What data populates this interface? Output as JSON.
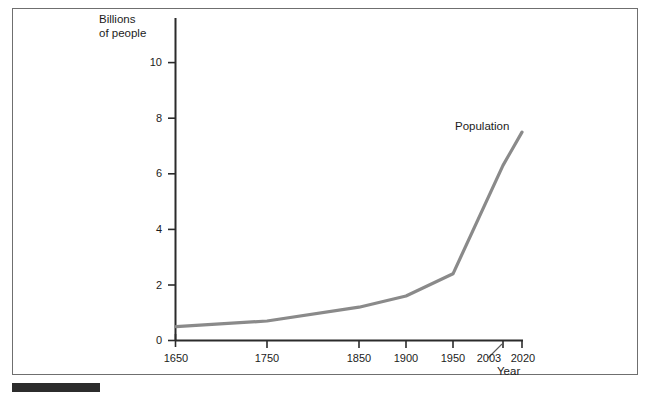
{
  "figure": {
    "y_axis_title_line1": "Billions",
    "y_axis_title_line2": "of people",
    "x_axis_title": "Year",
    "series_label": "Population",
    "line_color": "#8a8a8a",
    "axis_color": "#2b2b2b",
    "frame_color": "#6f6f6f",
    "caption_bar_color": "#2c2c2c",
    "text_color": "#1c1c1c"
  },
  "chart_data": {
    "type": "line",
    "title": "",
    "subtitle": "",
    "xlabel": "Year",
    "ylabel": "Billions of people",
    "legend": [
      "Population"
    ],
    "legend_position": "inline-right",
    "grid": false,
    "xlim": [
      1650,
      2020
    ],
    "ylim": [
      0,
      11
    ],
    "x_ticks": [
      1650,
      1750,
      1850,
      1900,
      1950,
      2003,
      2020
    ],
    "x_tick_labels": [
      "1650",
      "1750",
      "1850",
      "1900",
      "1950",
      "2003",
      "2020"
    ],
    "y_ticks": [
      0,
      2,
      4,
      6,
      8,
      10
    ],
    "y_tick_labels": [
      "0",
      "2",
      "4",
      "6",
      "8",
      "10"
    ],
    "series": [
      {
        "name": "Population",
        "x": [
          1650,
          1750,
          1850,
          1900,
          1950,
          2003,
          2020
        ],
        "values": [
          0.5,
          0.7,
          1.2,
          1.6,
          2.4,
          6.3,
          7.5
        ]
      }
    ],
    "annotations": [
      {
        "text": "Population",
        "x": 1965,
        "y": 8.0
      },
      {
        "text": "2003",
        "leader_line": true
      }
    ]
  }
}
